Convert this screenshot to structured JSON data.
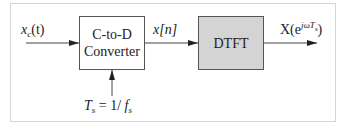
{
  "diagram": {
    "type": "block-diagram",
    "blocks": [
      {
        "id": "cd",
        "line1": "C-to-D",
        "line2": "Converter",
        "fill": "#ffffff"
      },
      {
        "id": "dtft",
        "label": "DTFT",
        "fill": "#d4d4d4"
      }
    ],
    "signals": {
      "input": {
        "base": "x",
        "sub": "c",
        "arg": "(t)"
      },
      "intermediate": {
        "text": "x[n]"
      },
      "output": {
        "base": "X(e",
        "sup": "jωT",
        "supsub": "s",
        "close": ")"
      },
      "sampling": {
        "lhs": "T",
        "lhs_sub": "s",
        "eq": " = 1/ ",
        "rhs": "f",
        "rhs_sub": "s"
      }
    },
    "edges": [
      {
        "from": "x_c(t)",
        "to": "C-to-D Converter"
      },
      {
        "from": "C-to-D Converter",
        "to": "DTFT",
        "label": "x[n]"
      },
      {
        "from": "DTFT",
        "to": "X(e^{jωT_s})"
      },
      {
        "from": "T_s = 1/f_s",
        "to": "C-to-D Converter"
      }
    ]
  }
}
